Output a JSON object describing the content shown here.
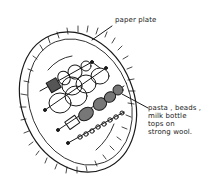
{
  "diagram": {
    "labels": {
      "plate": "paper plate",
      "items_lines": [
        "pasta , beads ,",
        "milk bottle",
        "tops   on",
        "strong wool."
      ]
    },
    "colors": {
      "ink": "#1a1a1a",
      "background": "#ffffff"
    },
    "strings": [
      {
        "kind": "cotton reels / spools"
      },
      {
        "kind": "milk bottle tops (large)"
      },
      {
        "kind": "milk bottle tops (small)"
      },
      {
        "kind": "pasta pieces"
      },
      {
        "kind": "beads"
      }
    ]
  }
}
